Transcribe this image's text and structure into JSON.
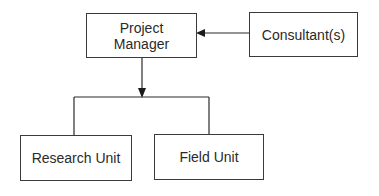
{
  "diagram": {
    "type": "org-chart",
    "nodes": {
      "project_manager": {
        "line1": "Project",
        "line2": "Manager"
      },
      "consultants": {
        "label": "Consultant(s)"
      },
      "research_unit": {
        "label": "Research Unit"
      },
      "field_unit": {
        "label": "Field Unit"
      }
    },
    "edges": [
      {
        "from": "Consultant(s)",
        "to": "Project Manager",
        "style": "arrow"
      },
      {
        "from": "Project Manager",
        "to": "Research Unit",
        "style": "arrow-branch"
      },
      {
        "from": "Project Manager",
        "to": "Field Unit",
        "style": "arrow-branch"
      }
    ],
    "colors": {
      "line": "#2a2a2a",
      "background": "#ffffff"
    }
  }
}
